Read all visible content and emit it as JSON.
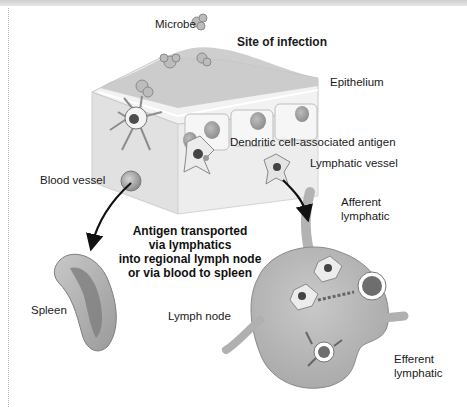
{
  "figure": {
    "title": "Site of infection",
    "labels": {
      "microbe": "Microbe",
      "site_of_infection": "Site of infection",
      "epithelium": "Epithelium",
      "dendritic_cell_antigen": "Dendritic cell-associated antigen",
      "lymphatic_vessel": "Lymphatic vessel",
      "blood_vessel": "Blood vessel",
      "afferent_lymphatic_line1": "Afferent",
      "afferent_lymphatic_line2": "lymphatic",
      "spleen": "Spleen",
      "lymph_node": "Lymph node",
      "efferent_lymphatic_line1": "Efferent",
      "efferent_lymphatic_line2": "lymphatic"
    },
    "caption_lines": [
      "Antigen transported",
      "via lymphatics",
      "into regional lymph node",
      "or via blood to spleen"
    ],
    "colors": {
      "tissue": "#e9e9e9",
      "tissue_side": "#d9d9d9",
      "epithelial_cell": "#f1f1f1",
      "nucleus": "#a9a9a9",
      "organ": "#b9b9b9",
      "organ_dark": "#8a8a8a",
      "arrow": "#111111"
    }
  }
}
